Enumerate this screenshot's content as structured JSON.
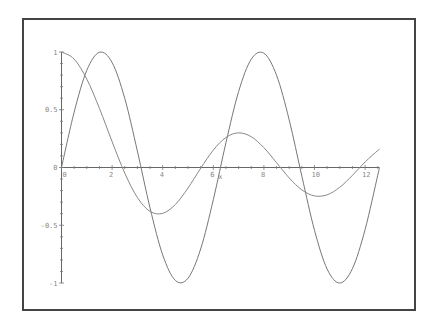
{
  "chart_data": {
    "type": "line",
    "title": "",
    "xlabel": "x",
    "ylabel": "",
    "xlim": [
      0,
      12.566
    ],
    "ylim": [
      -1,
      1
    ],
    "grid": false,
    "legend": null,
    "x_ticks": [
      0,
      2,
      4,
      6,
      8,
      10,
      12
    ],
    "x_tick_labels": [
      "0",
      "2",
      "4",
      "6",
      "8",
      "10",
      "12"
    ],
    "y_ticks": [
      -1,
      -0.5,
      0,
      0.5,
      1
    ],
    "y_tick_labels": [
      "-1",
      "-0.5",
      "0",
      "0.5",
      "1"
    ],
    "x": [
      0,
      0.5,
      1,
      1.5,
      2,
      2.5,
      3,
      3.5,
      4,
      4.5,
      5,
      5.5,
      6,
      6.5,
      7,
      7.5,
      8,
      8.5,
      9,
      9.5,
      10,
      10.5,
      11,
      11.5,
      12,
      12.5,
      12.566
    ],
    "series": [
      {
        "name": "sin(x)",
        "color": "#777777",
        "values": [
          0,
          0.4794,
          0.8415,
          0.9975,
          0.9093,
          0.5985,
          0.1411,
          -0.3508,
          -0.7568,
          -0.9775,
          -0.9589,
          -0.7055,
          -0.2794,
          0.2151,
          0.657,
          0.938,
          0.9894,
          0.7985,
          0.4121,
          -0.0752,
          -0.544,
          -0.8797,
          -1.0,
          -0.8755,
          -0.5366,
          -0.0663,
          0
        ]
      },
      {
        "name": "BesselJ(0,x)",
        "color": "#888888",
        "values": [
          1,
          0.9385,
          0.7652,
          0.5118,
          0.2239,
          -0.0484,
          -0.2601,
          -0.3801,
          -0.3971,
          -0.3205,
          -0.1776,
          -0.0068,
          0.1506,
          0.2601,
          0.3001,
          0.2663,
          0.1717,
          0.0419,
          -0.0903,
          -0.1939,
          -0.2459,
          -0.2366,
          -0.1712,
          -0.0677,
          0.0477,
          0.1469,
          0.156
        ]
      }
    ]
  }
}
